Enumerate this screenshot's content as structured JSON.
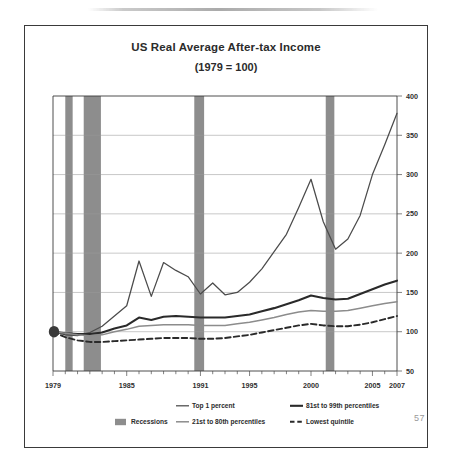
{
  "slide": {
    "page_number": "57"
  },
  "chart_data": {
    "type": "line",
    "title": "US Real Average After-tax Income",
    "subtitle": "(1979 = 100)",
    "xlabel": "",
    "ylabel": "",
    "xlim": [
      1979,
      2007
    ],
    "ylim": [
      50,
      400
    ],
    "yticks": [
      50,
      100,
      150,
      200,
      250,
      300,
      350,
      400
    ],
    "xticks": [
      1979,
      1985,
      1991,
      1995,
      2000,
      2005,
      2007
    ],
    "xtick_labels": [
      "1979",
      "1985",
      "1991",
      "1995",
      "2000",
      "2005",
      "2007"
    ],
    "ytick_labels": [
      "50",
      "100",
      "150",
      "200",
      "250",
      "300",
      "350",
      "400"
    ],
    "grid": true,
    "y_axis_position": "right",
    "legend_position": "bottom",
    "x": [
      1979,
      1980,
      1981,
      1982,
      1983,
      1984,
      1985,
      1986,
      1987,
      1988,
      1989,
      1990,
      1991,
      1992,
      1993,
      1994,
      1995,
      1996,
      1997,
      1998,
      1999,
      2000,
      2001,
      2002,
      2003,
      2004,
      2005,
      2006,
      2007
    ],
    "series": [
      {
        "name": "Top 1 percent",
        "style": "thin-solid",
        "color": "#4b4b4b",
        "values": [
          100,
          96,
          95,
          99,
          107,
          120,
          133,
          190,
          145,
          188,
          178,
          170,
          148,
          162,
          147,
          150,
          163,
          180,
          202,
          224,
          258,
          294,
          240,
          205,
          218,
          248,
          300,
          338,
          378
        ]
      },
      {
        "name": "81st to 99th percentiles",
        "style": "thick-solid",
        "color": "#2a2a2a",
        "values": [
          100,
          98,
          97,
          97,
          99,
          104,
          108,
          118,
          115,
          119,
          120,
          119,
          118,
          118,
          118,
          120,
          122,
          126,
          130,
          135,
          140,
          146,
          143,
          141,
          142,
          148,
          154,
          160,
          165
        ]
      },
      {
        "name": "21st to 80th percentiles",
        "style": "medium-solid",
        "color": "#8c8c8c",
        "values": [
          100,
          98,
          96,
          95,
          96,
          100,
          103,
          107,
          108,
          109,
          109,
          109,
          108,
          108,
          108,
          110,
          112,
          115,
          118,
          122,
          125,
          127,
          126,
          126,
          127,
          130,
          133,
          136,
          138
        ]
      },
      {
        "name": "Lowest quintile",
        "style": "dashed",
        "color": "#2a2a2a",
        "values": [
          100,
          93,
          89,
          87,
          87,
          88,
          89,
          90,
          91,
          92,
          92,
          92,
          91,
          91,
          92,
          94,
          96,
          99,
          102,
          105,
          108,
          110,
          108,
          107,
          107,
          109,
          112,
          116,
          120
        ]
      }
    ],
    "recessions": [
      {
        "start": 1980.0,
        "end": 1980.6
      },
      {
        "start": 1981.5,
        "end": 1982.9
      },
      {
        "start": 1990.5,
        "end": 1991.3
      },
      {
        "start": 2001.2,
        "end": 2001.9
      }
    ],
    "annotations": [
      {
        "type": "origin-marker",
        "x": 1979,
        "y": 100
      }
    ],
    "legend": [
      {
        "label": "Top 1 percent",
        "style": "thin-solid"
      },
      {
        "label": "81st to 99th percentiles",
        "style": "thick-solid"
      },
      {
        "label": "Recessions",
        "style": "swatch"
      },
      {
        "label": "21st to 80th percentiles",
        "style": "medium-solid"
      },
      {
        "label": "Lowest quintile",
        "style": "dashed"
      }
    ]
  }
}
